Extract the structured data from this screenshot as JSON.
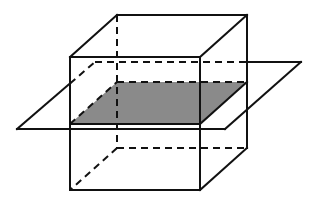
{
  "diagram": {
    "colors": {
      "stroke": "#111111",
      "shade": "#8a8a8a",
      "background": "#ffffff"
    },
    "cube": {
      "front_top_left": [
        70,
        57
      ],
      "front_top_right": [
        200,
        57
      ],
      "front_bottom_left": [
        70,
        190
      ],
      "front_bottom_right": [
        200,
        190
      ],
      "back_top_left": [
        117,
        15
      ],
      "back_top_right": [
        247,
        15
      ],
      "back_bottom_left": [
        117,
        148
      ],
      "back_bottom_right": [
        247,
        148
      ]
    },
    "plane": {
      "front_left": [
        17,
        129
      ],
      "front_right": [
        225,
        129
      ],
      "back_right": [
        301,
        62
      ],
      "back_left": [
        95,
        62
      ]
    },
    "cross_section": {
      "front_left": [
        70,
        124
      ],
      "front_right": [
        200,
        124
      ],
      "back_right": [
        247,
        82
      ],
      "back_left": [
        117,
        82
      ]
    }
  }
}
